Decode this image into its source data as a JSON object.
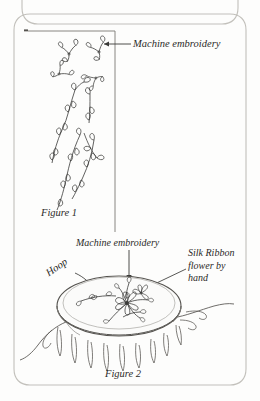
{
  "page": {
    "background": "#fdfdfc",
    "ink": "#3a3a38",
    "border_color": "#b9b7b2"
  },
  "borders": [
    {
      "name": "page-border-top-partial",
      "note": "rounded rectangle clipped at top of image"
    },
    {
      "name": "page-border-main",
      "note": "main rounded rectangle frame"
    }
  ],
  "figure1": {
    "caption": "Figure 1",
    "callout": {
      "label": "Machine embroidery",
      "icon": "arrow-left-icon"
    },
    "swatch": {
      "name": "fabric-swatch-outline",
      "description": "corner rule of fabric piece"
    },
    "motifs": [
      {
        "name": "vine-sprig",
        "type": "leaf-sprig"
      },
      {
        "name": "vine-sprig",
        "type": "leaf-sprig"
      },
      {
        "name": "vine-sprig",
        "type": "leaf-sprig"
      },
      {
        "name": "vine-sprig",
        "type": "leaf-sprig"
      },
      {
        "name": "vine-trail",
        "type": "leafy-vine"
      },
      {
        "name": "vine-trail",
        "type": "leafy-vine"
      },
      {
        "name": "vine-trail",
        "type": "leafy-vine"
      }
    ]
  },
  "figure2": {
    "caption": "Figure 2",
    "labels": {
      "machine_embroidery": "Machine embroidery",
      "hoop": "Hoop",
      "silk_ribbon_l1": "Silk Ribbon",
      "silk_ribbon_l2": "flower by",
      "silk_ribbon_l3": "hand"
    },
    "objects": [
      {
        "name": "embroidery-hoop",
        "shape": "ellipse-with-rim"
      },
      {
        "name": "fabric-drape",
        "shape": "gathered-cloth"
      },
      {
        "name": "silk-ribbon-flower-cluster",
        "shape": "flower-spray"
      },
      {
        "name": "machine-embroidery-vine",
        "shape": "leafy-vine"
      }
    ],
    "pointers": [
      {
        "name": "arrow-down-icon",
        "target": "machine-embroidery-vine"
      },
      {
        "name": "leader-line",
        "target": "silk-ribbon-flower-cluster"
      },
      {
        "name": "leader-line",
        "target": "embroidery-hoop"
      }
    ]
  }
}
